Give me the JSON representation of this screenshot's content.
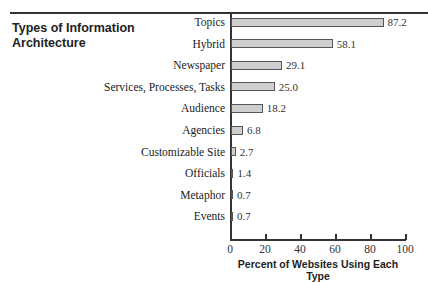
{
  "chart_data": {
    "type": "bar",
    "orientation": "horizontal",
    "title": "Types of Information Architecture",
    "xlabel": "Percent of Websites Using Each Type",
    "ylabel": "",
    "categories": [
      "Topics",
      "Hybrid",
      "Newspaper",
      "Services, Processes, Tasks",
      "Audience",
      "Agencies",
      "Customizable Site",
      "Officials",
      "Metaphor",
      "Events"
    ],
    "values": [
      87.2,
      58.1,
      29.1,
      25.0,
      18.2,
      6.8,
      2.7,
      1.4,
      0.7,
      0.7
    ],
    "value_labels": [
      "87.2",
      "58.1",
      "29.1",
      "25.0",
      "18.2",
      "6.8",
      "2.7",
      "1.4",
      "0.7",
      "0.7"
    ],
    "xlim": [
      0,
      100
    ],
    "xticks": [
      "0",
      "20",
      "40",
      "60",
      "80",
      "100"
    ],
    "grid": false,
    "legend": null,
    "bar_color": "#cfcfcf"
  }
}
